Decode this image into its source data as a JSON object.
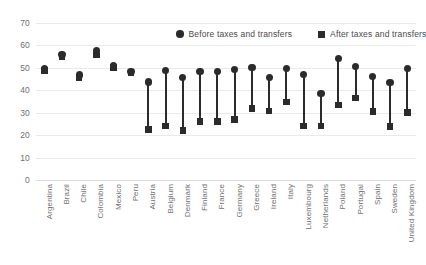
{
  "chart_data": {
    "type": "scatter",
    "subtype": "dumbbell",
    "title": "",
    "xlabel": "",
    "ylabel": "",
    "ylim": [
      0,
      70
    ],
    "yticks": [
      0,
      10,
      20,
      30,
      40,
      50,
      60,
      70
    ],
    "grid": true,
    "legend_position": "top-center",
    "categories": [
      "Argentina",
      "Brazil",
      "Chile",
      "Colombia",
      "Mexico",
      "Peru",
      "Austria",
      "Belgium",
      "Denmark",
      "Finland",
      "France",
      "Germany",
      "Greece",
      "Ireland",
      "Italy",
      "Luxembourg",
      "Netherlands",
      "Poland",
      "Portugal",
      "Spain",
      "Sweden",
      "United Kingdom"
    ],
    "series": [
      {
        "name": "Before taxes and transfers",
        "marker": "circle",
        "color": "#2b2b2b",
        "values": [
          49.5,
          55.8,
          46.8,
          57.8,
          51.0,
          48.4,
          43.7,
          49.0,
          45.8,
          48.5,
          48.5,
          49.3,
          50.2,
          45.8,
          49.6,
          47.2,
          38.4,
          54.2,
          50.6,
          46.0,
          43.5,
          49.7
        ]
      },
      {
        "name": "After taxes and transfers",
        "marker": "square",
        "color": "#2b2b2b",
        "values": [
          48.8,
          54.8,
          45.8,
          55.8,
          50.2,
          47.7,
          22.6,
          24.0,
          22.2,
          26.1,
          26.1,
          26.9,
          31.9,
          30.8,
          34.7,
          24.0,
          24.1,
          33.5,
          36.5,
          30.6,
          23.9,
          30.2
        ]
      }
    ],
    "legend": [
      {
        "label": "Before taxes and transfers",
        "marker": "circle"
      },
      {
        "label": "After taxes and transfers",
        "marker": "square"
      }
    ]
  }
}
